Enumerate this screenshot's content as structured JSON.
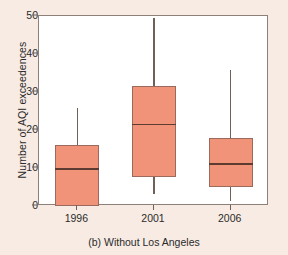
{
  "chart_data": {
    "type": "box",
    "title": "",
    "caption": "(b) Without Los Angeles",
    "xlabel": "",
    "ylabel": "Number of AQI exceedences",
    "ylim": [
      0,
      50
    ],
    "yticks": [
      0,
      10,
      20,
      30,
      40,
      50
    ],
    "ytick_labels": [
      "0",
      "10",
      "20",
      "30",
      "40",
      "50"
    ],
    "grid": false,
    "legend": "none",
    "categories": [
      "1996",
      "2001",
      "2006"
    ],
    "box_fill_color": "#f09379",
    "box_edge_color": "#9b6a5d",
    "median_color": "#5d3b31",
    "whisker_color": "#706058",
    "plot_background": "#ffffff",
    "figure_background": "#f7ebe3",
    "boxes": [
      {
        "category": "1996",
        "whisker_low": 0,
        "q1": 0,
        "median": 9.7,
        "q3": 16,
        "whisker_high": 25.8
      },
      {
        "category": "2001",
        "whisker_low": 3.2,
        "q1": 7.5,
        "median": 21.4,
        "q3": 31.5,
        "whisker_high": 49.5
      },
      {
        "category": "2006",
        "whisker_low": 1.3,
        "q1": 5,
        "median": 11,
        "q3": 18,
        "whisker_high": 35.8
      }
    ]
  }
}
